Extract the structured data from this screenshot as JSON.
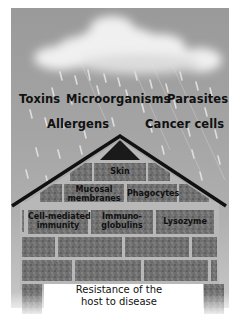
{
  "threats": {
    "toxins": "Toxins",
    "microorganisms": "Microorganisms",
    "parasites": "Parasites",
    "allergens": "Allergens",
    "cancer_cells": "Cancer cells"
  },
  "defenses": {
    "skin": "Skin",
    "mucosal_line1": "Mucosal",
    "mucosal_line2": "membranes",
    "phagocytes": "Phagocytes",
    "cell_mediated_line1": "Cell-mediated",
    "cell_mediated_line2": "immunity",
    "immuno_line1": "Immuno-",
    "immuno_line2": "globulins",
    "lysozyme": "Lysozyme"
  },
  "caption": {
    "line1": "Resistance of the",
    "line2": "host to disease"
  },
  "colors": {
    "sky": "#a4a4a4",
    "brick": "#6e6e6e",
    "mortar": "#b8b8b8",
    "roof": "#111111"
  }
}
